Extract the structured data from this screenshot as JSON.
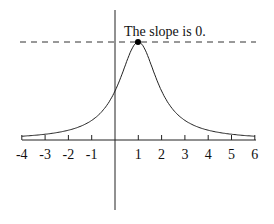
{
  "annotation": "The slope is 0.",
  "chart_data": {
    "type": "line",
    "title": "",
    "xlabel": "",
    "ylabel": "",
    "x_ticks": [
      "-4",
      "-3",
      "-2",
      "-1",
      "1",
      "2",
      "3",
      "4",
      "5",
      "6"
    ],
    "xlim": [
      -4,
      6
    ],
    "grid": false,
    "function": "y = 1 / (1 + (x - 1)^2)",
    "x": [
      -4,
      -3,
      -2,
      -1,
      0,
      0.5,
      1,
      1.5,
      2,
      3,
      4,
      5,
      6
    ],
    "values": [
      0.038,
      0.059,
      0.1,
      0.2,
      0.5,
      0.8,
      1.0,
      0.8,
      0.5,
      0.2,
      0.1,
      0.059,
      0.038
    ],
    "max_point": {
      "x": 1,
      "y": 1
    },
    "tangent_line": {
      "type": "horizontal dashed",
      "y": 1
    },
    "annotations": [
      {
        "text": "The slope is 0.",
        "x": 1,
        "y": 1
      }
    ]
  }
}
